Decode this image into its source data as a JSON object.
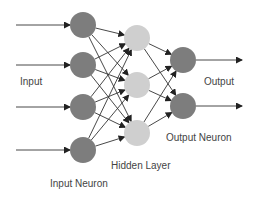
{
  "diagram": {
    "labels": {
      "input": "Input",
      "output": "Output",
      "input_neuron": "Input Neuron",
      "hidden_layer": "Hidden Layer",
      "output_neuron": "Output Neuron"
    },
    "layers": [
      {
        "name": "input",
        "count": 4,
        "color": "#7d7d7d"
      },
      {
        "name": "hidden",
        "count": 3,
        "color": "#cfcfcf"
      },
      {
        "name": "output",
        "count": 2,
        "color": "#7d7d7d"
      }
    ],
    "edge_color": "#333333"
  }
}
